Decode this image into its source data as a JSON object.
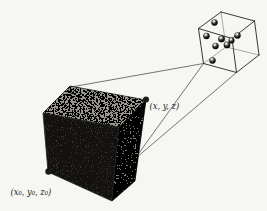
{
  "figure": {
    "labels": {
      "point": "(x, y, z)",
      "origin": "(x₀, y₀, z₀)"
    },
    "colors": {
      "paper": "#f6f6f3",
      "ink": "#1c1c1c",
      "connector_line": "#3c3c3a",
      "hidden_edge": "#6a6a66",
      "wire_edge": "#23231f",
      "top_face_base": "#98968c",
      "right_face_base": "#7c7a72",
      "front_face": "#131210",
      "marker_dot": "#1a1a18"
    },
    "big_cube": {
      "top_face": [
        [
          70,
          86
        ],
        [
          146,
          100
        ],
        [
          119,
          127
        ],
        [
          43,
          113
        ]
      ],
      "front_face": [
        [
          43,
          113
        ],
        [
          119,
          127
        ],
        [
          112,
          201
        ],
        [
          48,
          172
        ]
      ],
      "right_face": [
        [
          146,
          100
        ],
        [
          119,
          127
        ],
        [
          112,
          201
        ],
        [
          135,
          181
        ]
      ],
      "markers": [
        {
          "name": "point-xyz-marker",
          "x": 146,
          "y": 99.5,
          "r": 3
        },
        {
          "name": "origin-marker",
          "x": 48.5,
          "y": 171.5,
          "r": 3.2
        }
      ]
    },
    "small_cube": {
      "vertices": {
        "A": [
          221,
          12
        ],
        "B": [
          254.5,
          21
        ],
        "C": [
          232,
          38.5
        ],
        "D": [
          198.5,
          28.5
        ],
        "Ap": [
          226,
          47
        ],
        "Bp": [
          259,
          55
        ],
        "Cp": [
          236.5,
          72.5
        ],
        "Dp": [
          203.5,
          63.5
        ]
      },
      "visible_edges": [
        [
          "A",
          "B"
        ],
        [
          "B",
          "C"
        ],
        [
          "C",
          "D"
        ],
        [
          "D",
          "A"
        ],
        [
          "D",
          "Dp"
        ],
        [
          "C",
          "Cp"
        ],
        [
          "B",
          "Bp"
        ],
        [
          "Dp",
          "Cp"
        ],
        [
          "Cp",
          "Bp"
        ]
      ],
      "hidden_edges": [
        [
          "A",
          "Ap"
        ],
        [
          "Ap",
          "Dp"
        ],
        [
          "Ap",
          "Bp"
        ]
      ]
    },
    "molecules": [
      {
        "x": 214.5,
        "y": 22.5,
        "r": 3.1
      },
      {
        "x": 206.5,
        "y": 36.0,
        "r": 3.1
      },
      {
        "x": 221.5,
        "y": 39.0,
        "r": 3.2
      },
      {
        "x": 237.5,
        "y": 35.5,
        "r": 3.1
      },
      {
        "x": 231.5,
        "y": 40.5,
        "r": 2.9
      },
      {
        "x": 215.5,
        "y": 46.0,
        "r": 3.1
      },
      {
        "x": 227.0,
        "y": 45.0,
        "r": 3.2
      },
      {
        "x": 212.5,
        "y": 60.5,
        "r": 3.1
      }
    ],
    "connectors": [
      {
        "from": [
          71,
          87
        ],
        "to": [
          203.5,
          63.5
        ]
      },
      {
        "from": [
          139,
          153
        ],
        "to": [
          203.5,
          63.5
        ]
      },
      {
        "from": [
          139.5,
          155
        ],
        "to": [
          236.5,
          72.5
        ]
      }
    ]
  }
}
